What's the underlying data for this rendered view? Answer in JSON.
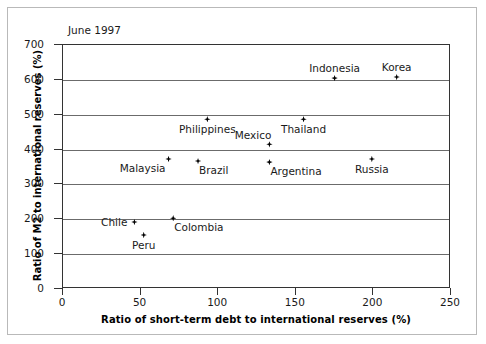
{
  "chart_data": {
    "type": "scatter",
    "title": "June 1997",
    "xlabel": "Ratio of short-term debt to international reserves (%)",
    "ylabel": "Ratio of M2 to international reserves (%)",
    "xlim": [
      0,
      250
    ],
    "ylim": [
      0,
      700
    ],
    "xticks": [
      "0",
      "50",
      "100",
      "150",
      "200",
      "250"
    ],
    "yticks": [
      "0",
      "100",
      "200",
      "300",
      "400",
      "500",
      "600",
      "700"
    ],
    "grid": "horizontal",
    "legend": "none",
    "marker_color": "#000000",
    "points": [
      {
        "label": "Indonesia",
        "x": 175,
        "y": 605,
        "label_pos": "above"
      },
      {
        "label": "Korea",
        "x": 215,
        "y": 608,
        "label_pos": "above"
      },
      {
        "label": "Philippines",
        "x": 93,
        "y": 487,
        "label_pos": "below"
      },
      {
        "label": "Thailand",
        "x": 155,
        "y": 487,
        "label_pos": "below"
      },
      {
        "label": "Mexico",
        "x": 133,
        "y": 415,
        "label_pos": "above-left"
      },
      {
        "label": "Malaysia",
        "x": 68,
        "y": 373,
        "label_pos": "below-left"
      },
      {
        "label": "Brazil",
        "x": 87,
        "y": 367,
        "label_pos": "below-right"
      },
      {
        "label": "Argentina",
        "x": 133,
        "y": 364,
        "label_pos": "below-right"
      },
      {
        "label": "Russia",
        "x": 199,
        "y": 373,
        "label_pos": "below"
      },
      {
        "label": "Chile",
        "x": 46,
        "y": 192,
        "label_pos": "left"
      },
      {
        "label": "Colombia",
        "x": 71,
        "y": 203,
        "label_pos": "below-right"
      },
      {
        "label": "Peru",
        "x": 52,
        "y": 155,
        "label_pos": "below"
      }
    ]
  }
}
